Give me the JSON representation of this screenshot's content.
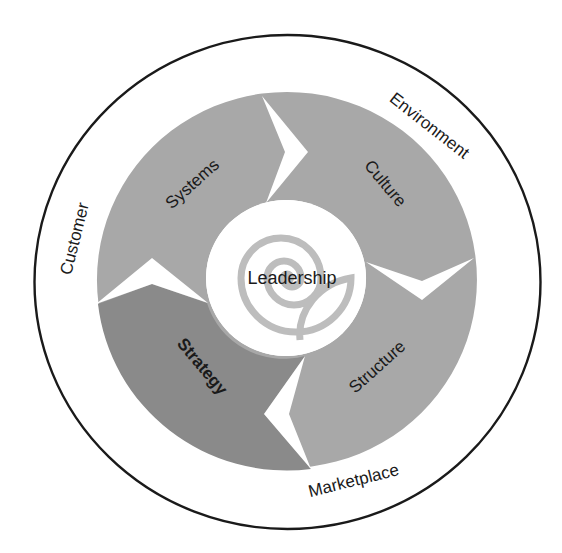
{
  "diagram": {
    "type": "concentric-cycle",
    "outer_ring": {
      "labels": {
        "top_right": "Environment",
        "left": "Customer",
        "bottom": "Marketplace"
      }
    },
    "cycle_segments": [
      {
        "label": "Systems",
        "position": "top-left",
        "emphasis": false
      },
      {
        "label": "Culture",
        "position": "top-right",
        "emphasis": false
      },
      {
        "label": "Structure",
        "position": "bottom-right",
        "emphasis": false
      },
      {
        "label": "Strategy",
        "position": "bottom-left",
        "emphasis": true
      }
    ],
    "center": {
      "label": "Leadership",
      "icon": "spiral-icon"
    },
    "colors": {
      "outline": "#1a1a1a",
      "segment": "#a8a8a8",
      "segment_emphasis": "#8a8a8a",
      "spiral": "#bdbdbd",
      "background": "#ffffff"
    }
  }
}
